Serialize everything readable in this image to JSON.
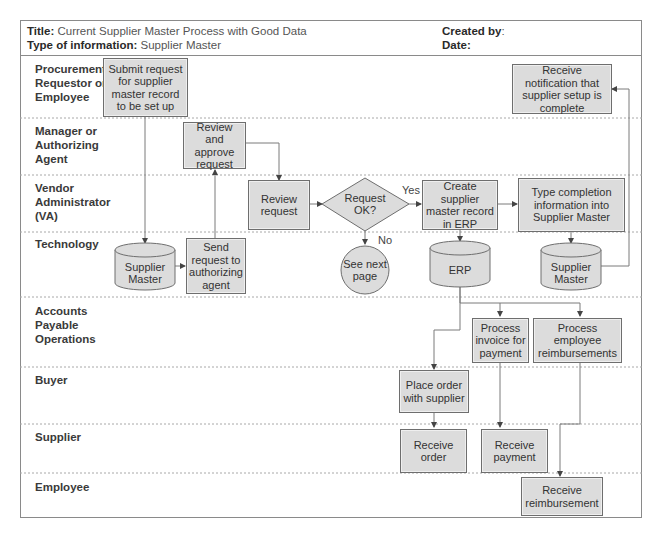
{
  "header": {
    "title_label": "Title:",
    "title_value": " Current Supplier Master Process with Good Data",
    "type_label": "Type of information:",
    "type_value": " Supplier Master",
    "created_label": "Created by",
    "created_value": ":",
    "date_label": "Date:"
  },
  "lanes": [
    {
      "id": "procurement",
      "label": "Procurement\nRequestor or\nEmployee"
    },
    {
      "id": "manager",
      "label": "Manager or\nAuthorizing\nAgent"
    },
    {
      "id": "vendor",
      "label": "Vendor\nAdministrator\n(VA)"
    },
    {
      "id": "technology",
      "label": "Technology"
    },
    {
      "id": "ap",
      "label": "Accounts\nPayable\nOperations"
    },
    {
      "id": "buyer",
      "label": "Buyer"
    },
    {
      "id": "supplier",
      "label": "Supplier"
    },
    {
      "id": "employee",
      "label": "Employee"
    }
  ],
  "nodes": {
    "submit": "Submit request for supplier master record to be set up",
    "notify": "Receive notification that supplier setup is complete",
    "approve": "Review and approve request",
    "review": "Review request",
    "decision": "Request OK?",
    "create": "Create supplier master record in ERP",
    "type_completion": "Type completion information into Supplier Master",
    "db_supplier1": "Supplier Master",
    "send": "Send request to authorizing agent",
    "see_next": "See next page",
    "db_erp": "ERP",
    "db_supplier2": "Supplier Master",
    "process_invoice": "Process invoice for payment",
    "process_reimb": "Process employee reimbursements",
    "place_order": "Place order with supplier",
    "receive_order": "Receive order",
    "receive_payment": "Receive payment",
    "receive_reimb": "Receive reimbursement"
  },
  "edge_labels": {
    "yes": "Yes",
    "no": "No"
  },
  "colors": {
    "box_fill": "#dcdcdc",
    "border": "#6e6e6e",
    "line": "#7a7a7a"
  }
}
